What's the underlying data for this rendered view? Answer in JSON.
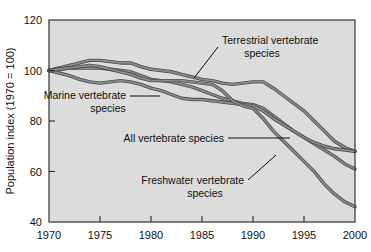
{
  "chart_data": {
    "type": "line",
    "title": "",
    "xlabel": "",
    "ylabel": "Population index (1970 = 100)",
    "xlim": [
      1970,
      2000
    ],
    "ylim": [
      40,
      120
    ],
    "xticks": [
      "1970",
      "1975",
      "1980",
      "1985",
      "1990",
      "1995",
      "2000"
    ],
    "yticks": [
      "40",
      "60",
      "80",
      "100",
      "120"
    ],
    "grid": false,
    "legend_position": "inline-annotations",
    "plot_background": "#dcdcdc",
    "line_color": "#8a8a8a",
    "line_edge_color": "#4d4d4d",
    "x": [
      1970,
      1971,
      1972,
      1973,
      1974,
      1975,
      1976,
      1977,
      1978,
      1979,
      1980,
      1981,
      1982,
      1983,
      1984,
      1985,
      1986,
      1987,
      1988,
      1989,
      1990,
      1991,
      1992,
      1993,
      1994,
      1995,
      1996,
      1997,
      1998,
      1999,
      2000
    ],
    "series": [
      {
        "name": "Terrestrial vertebrate species",
        "values": [
          100,
          101,
          102,
          103,
          104,
          104,
          103.5,
          103,
          103,
          101.5,
          100.5,
          100,
          99.5,
          98.5,
          97.5,
          96.5,
          96,
          95,
          94.5,
          95,
          95.5,
          95.5,
          93,
          90,
          87,
          84,
          80,
          76,
          72,
          69.5,
          68
        ]
      },
      {
        "name": "All vertebrate species",
        "values": [
          100,
          100.5,
          101,
          101,
          101,
          101,
          100.5,
          100,
          99.5,
          98,
          96.5,
          96,
          95.5,
          94.5,
          93.5,
          92,
          90.5,
          89,
          88,
          87,
          86.5,
          85,
          82,
          79,
          76,
          73.5,
          71,
          68.5,
          66,
          63,
          61
        ]
      },
      {
        "name": "Marine vertebrate species",
        "values": [
          100,
          99,
          98,
          96.5,
          95.5,
          95,
          95.5,
          96,
          95.5,
          94.5,
          93,
          92,
          90.5,
          89,
          88.5,
          88.5,
          88,
          87.5,
          87,
          86.5,
          86,
          84,
          81,
          78.5,
          76,
          73.5,
          71.5,
          70,
          69,
          68.5,
          68
        ]
      },
      {
        "name": "Freshwater vertebrate species",
        "values": [
          100,
          100.5,
          101,
          101.5,
          102,
          101.5,
          100.5,
          99.5,
          98.5,
          97,
          96,
          96,
          96,
          96,
          95.5,
          95,
          94.5,
          92,
          88,
          86,
          85,
          81,
          76,
          72,
          68,
          64,
          60,
          55,
          51,
          48,
          46
        ]
      }
    ],
    "annotations": [
      {
        "id": "terrestrial",
        "text_line1": "Terrestrial vertebrate",
        "text_line2": "species"
      },
      {
        "id": "marine",
        "text_line1": "Marine vertebrate",
        "text_line2": "species"
      },
      {
        "id": "all",
        "text_line1": "All vertebrate species",
        "text_line2": ""
      },
      {
        "id": "freshwater",
        "text_line1": "Freshwater vertebrate",
        "text_line2": "species"
      }
    ]
  }
}
